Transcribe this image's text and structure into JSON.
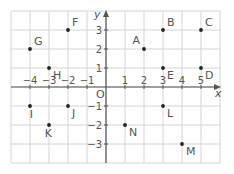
{
  "chart_data": {
    "type": "scatter",
    "title": "",
    "xlabel": "x",
    "ylabel": "y",
    "origin_label": "O",
    "xlim": [
      -5,
      6
    ],
    "ylim": [
      -4,
      4
    ],
    "grid": true,
    "xticks": [
      -4,
      -3,
      -2,
      -1,
      1,
      2,
      3,
      4,
      5
    ],
    "yticks": [
      -3,
      -2,
      -1,
      1,
      2,
      3
    ],
    "xtick_labels": [
      "−4",
      "−3",
      "−2",
      "−1",
      "1",
      "2",
      "3",
      "4",
      "5"
    ],
    "ytick_labels": [
      "−3",
      "−2",
      "−1",
      "1",
      "2",
      "3"
    ],
    "points": [
      {
        "label": "A",
        "x": 2,
        "y": 2,
        "pos": "tl"
      },
      {
        "label": "B",
        "x": 3,
        "y": 3,
        "pos": "tr"
      },
      {
        "label": "C",
        "x": 5,
        "y": 3,
        "pos": "tr"
      },
      {
        "label": "D",
        "x": 5,
        "y": 1,
        "pos": "br"
      },
      {
        "label": "E",
        "x": 3,
        "y": 1,
        "pos": "br"
      },
      {
        "label": "F",
        "x": -2,
        "y": 3,
        "pos": "tr"
      },
      {
        "label": "G",
        "x": -4,
        "y": 2,
        "pos": "tr"
      },
      {
        "label": "H",
        "x": -3,
        "y": 1,
        "pos": "br"
      },
      {
        "label": "I",
        "x": -4,
        "y": -1,
        "pos": "bl"
      },
      {
        "label": "J",
        "x": -2,
        "y": -1,
        "pos": "br"
      },
      {
        "label": "K",
        "x": -3,
        "y": -2,
        "pos": "bl"
      },
      {
        "label": "L",
        "x": 3,
        "y": -1,
        "pos": "br"
      },
      {
        "label": "M",
        "x": 4,
        "y": -3,
        "pos": "br"
      },
      {
        "label": "N",
        "x": 1,
        "y": -2,
        "pos": "br"
      }
    ]
  }
}
